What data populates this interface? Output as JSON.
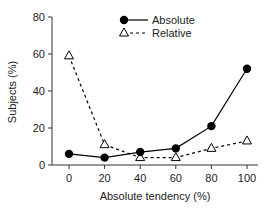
{
  "chart_data": {
    "type": "line",
    "title": "",
    "xlabel": "Absolute tendency (%)",
    "ylabel": "Subjects (%)",
    "x": [
      0,
      20,
      40,
      60,
      80,
      100
    ],
    "xticks": [
      "0",
      "20",
      "40",
      "60",
      "80",
      "100"
    ],
    "yticks": [
      "0",
      "20",
      "40",
      "60",
      "80"
    ],
    "xlim": [
      -8,
      108
    ],
    "ylim": [
      0,
      80
    ],
    "grid": false,
    "legend_position": "upper right",
    "series": [
      {
        "name": "Absolute",
        "values": [
          6,
          4,
          7,
          9,
          21,
          52
        ],
        "marker": "filled-circle",
        "line": "solid",
        "color": "#000000"
      },
      {
        "name": "Relative",
        "values": [
          59,
          11,
          4,
          4,
          9,
          13
        ],
        "marker": "open-triangle",
        "line": "dashed",
        "color": "#000000"
      }
    ]
  }
}
